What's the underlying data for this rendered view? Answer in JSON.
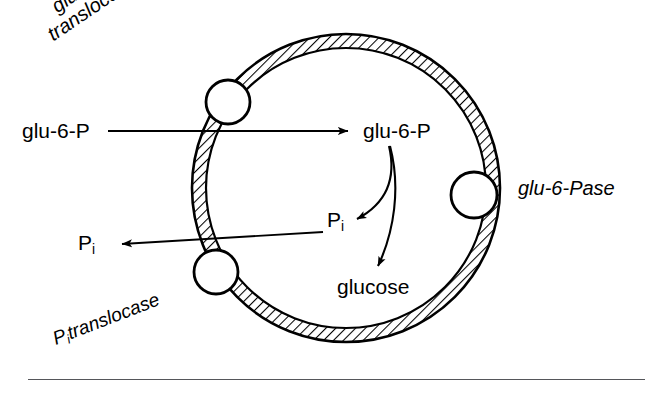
{
  "figure": {
    "type": "cell-membrane-transport-diagram",
    "background_color": "#ffffff",
    "ink_color": "#000000",
    "rule_color": "#55565a"
  },
  "membrane": {
    "name": "membrane-vesicle",
    "center_x": 346,
    "center_y": 188,
    "outer_radius": 154,
    "inner_radius": 140,
    "hatch_angle_deg": 45,
    "stroke_color": "#000000"
  },
  "labels": {
    "glu6p_outside": "glu-6-P",
    "glu6p_inside": "glu-6-P",
    "pi_outside_base": "P",
    "pi_outside_sub": "i",
    "pi_inside_base": "P",
    "pi_inside_sub": "i",
    "glucose": "glucose",
    "glu6p_translocase_line1": "glu-6-P",
    "glu6p_translocase_line2": "translocase",
    "pi_translocase_base": "P",
    "pi_translocase_sub": "i",
    "pi_translocase_word": "translocase",
    "glu6pase": "glu-6-Pase"
  },
  "transporters": [
    {
      "name": "glu-6-P translocase",
      "cx": 228,
      "cy": 102,
      "r": 22,
      "position": "spans-membrane-upper-left"
    },
    {
      "name": "Pi translocase",
      "cx": 216,
      "cy": 272,
      "r": 22,
      "position": "spans-membrane-lower-left"
    },
    {
      "name": "glu-6-Pase",
      "cx": 474,
      "cy": 195,
      "r": 23,
      "position": "inner-face-right"
    }
  ],
  "arrows": [
    {
      "name": "glu-6-P import arrow",
      "from": "glu-6-P (outside)",
      "to": "glu-6-P (inside)",
      "direction": "rightward",
      "style": "straight"
    },
    {
      "name": "Pi export arrow",
      "from": "P_i (inside)",
      "to": "P_i (outside)",
      "direction": "leftward",
      "style": "straight"
    },
    {
      "name": "phosphate release arrow",
      "from": "glu-6-P (inside)",
      "to": "P_i (inside)",
      "direction": "down-left",
      "style": "curved"
    },
    {
      "name": "glucose formation arrow",
      "from": "glu-6-P (inside)",
      "to": "glucose",
      "direction": "downward",
      "style": "curved"
    }
  ]
}
